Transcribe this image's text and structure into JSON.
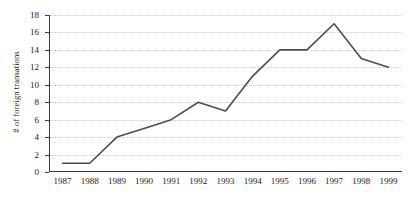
{
  "chart_data": {
    "type": "line",
    "title": "",
    "xlabel": "",
    "ylabel": "# of foreign transations",
    "categories": [
      "1987",
      "1988",
      "1989",
      "1990",
      "1991",
      "1992",
      "1993",
      "1994",
      "1995",
      "1996",
      "1997",
      "1998",
      "1999"
    ],
    "values": [
      1,
      1,
      4,
      5,
      6,
      8,
      7,
      11,
      14,
      14,
      17,
      13,
      12
    ],
    "series": [
      {
        "name": "# of foreign transations",
        "values": [
          1,
          1,
          4,
          5,
          6,
          8,
          7,
          11,
          14,
          14,
          17,
          13,
          12
        ]
      }
    ],
    "ylim": [
      0,
      18
    ],
    "yticks": [
      0,
      2,
      4,
      6,
      8,
      10,
      12,
      14,
      16,
      18
    ],
    "ytick_labels": [
      "0",
      "2",
      "4",
      "6",
      "8",
      "10",
      "12",
      "14",
      "16",
      "18"
    ],
    "grid": "horizontal-dotted",
    "legend": "none",
    "line_color": "#4d4d4d",
    "grid_color": "#c9c9c9",
    "axis_color": "#3a3a3a",
    "background": "#ffffff"
  }
}
